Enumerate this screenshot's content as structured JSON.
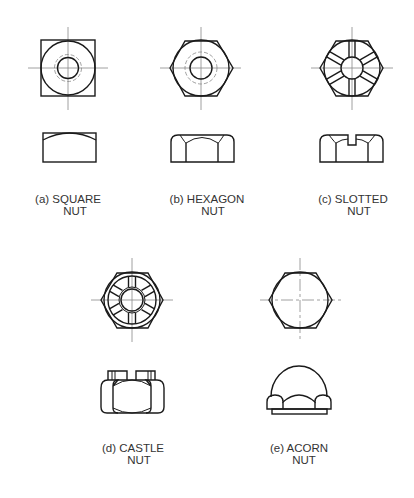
{
  "figure": {
    "background": "#ffffff",
    "line_color": "#1a1a1a",
    "centerline_color": "#888888",
    "nuts": [
      {
        "id": "a",
        "line1": "(a) SQUARE",
        "line2": "NUT"
      },
      {
        "id": "b",
        "line1": "(b) HEXAGON",
        "line2": "NUT"
      },
      {
        "id": "c",
        "line1": "(c) SLOTTED",
        "line2": "NUT"
      },
      {
        "id": "d",
        "line1": "(d) CASTLE",
        "line2": "NUT"
      },
      {
        "id": "e",
        "line1": "(e) ACORN",
        "line2": "NUT"
      }
    ]
  }
}
